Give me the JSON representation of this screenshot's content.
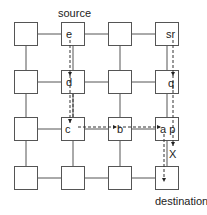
{
  "diagram": {
    "type": "mesh-network-routing",
    "grid": {
      "rows": 4,
      "cols": 4
    },
    "colors": {
      "stroke": "#555555",
      "dashed": "#333333",
      "text": "#222222",
      "background": "#ffffff"
    },
    "labels": {
      "source": "source",
      "destination": "destination",
      "blocked": "X"
    },
    "nodes": [
      {
        "row": 0,
        "col": 0,
        "text": ""
      },
      {
        "row": 0,
        "col": 1,
        "text": "e"
      },
      {
        "row": 0,
        "col": 2,
        "text": ""
      },
      {
        "row": 0,
        "col": 3,
        "text": "sr"
      },
      {
        "row": 1,
        "col": 0,
        "text": ""
      },
      {
        "row": 1,
        "col": 1,
        "text": "d"
      },
      {
        "row": 1,
        "col": 2,
        "text": ""
      },
      {
        "row": 1,
        "col": 3,
        "text": "q"
      },
      {
        "row": 2,
        "col": 0,
        "text": ""
      },
      {
        "row": 2,
        "col": 1,
        "text": "c"
      },
      {
        "row": 2,
        "col": 2,
        "text": "b"
      },
      {
        "row": 2,
        "col": 3,
        "text": "a p"
      },
      {
        "row": 3,
        "col": 0,
        "text": ""
      },
      {
        "row": 3,
        "col": 1,
        "text": ""
      },
      {
        "row": 3,
        "col": 2,
        "text": ""
      },
      {
        "row": 3,
        "col": 3,
        "text": ""
      }
    ],
    "paths": [
      {
        "name": "path-e-d-c-b-a-destination",
        "via": [
          "e",
          "d",
          "c",
          "b",
          "a",
          "destination"
        ]
      },
      {
        "name": "path-sr-q-p-X",
        "via": [
          "sr",
          "q",
          "p",
          "X"
        ]
      }
    ]
  }
}
